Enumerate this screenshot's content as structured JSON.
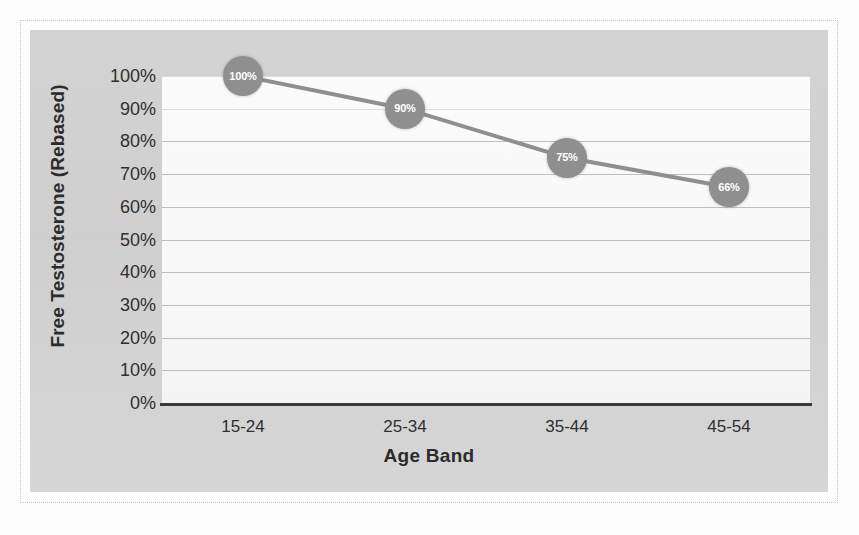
{
  "chart_data": {
    "type": "line",
    "title": "",
    "xlabel": "Age Band",
    "ylabel": "Free Testosterone (Rebased)",
    "categories": [
      "15-24",
      "25-34",
      "35-44",
      "45-54"
    ],
    "values": [
      100,
      90,
      75,
      66
    ],
    "point_labels": [
      "100%",
      "90%",
      "75%",
      "66%"
    ],
    "ylim": [
      0,
      100
    ],
    "ytick_values": [
      0,
      10,
      20,
      30,
      40,
      50,
      60,
      70,
      80,
      90,
      100
    ],
    "ytick_labels": [
      "0%",
      "10%",
      "20%",
      "30%",
      "40%",
      "50%",
      "60%",
      "70%",
      "80%",
      "90%",
      "100%"
    ],
    "grid": true,
    "legend": false,
    "legend_position": "none",
    "series": [
      {
        "name": "Free Testosterone (Rebased)",
        "values": [
          100,
          90,
          75,
          66
        ]
      }
    ],
    "colors": {
      "line": "#8f8f8f",
      "marker": "#8f8f8f",
      "marker_label": "#ffffff",
      "gridline": "#9a9a9a",
      "axis": "#3a3a3a",
      "plot_background": "#fbfbfb",
      "chart_background": "#d3d3d3",
      "text": "#2f2f2f"
    }
  }
}
